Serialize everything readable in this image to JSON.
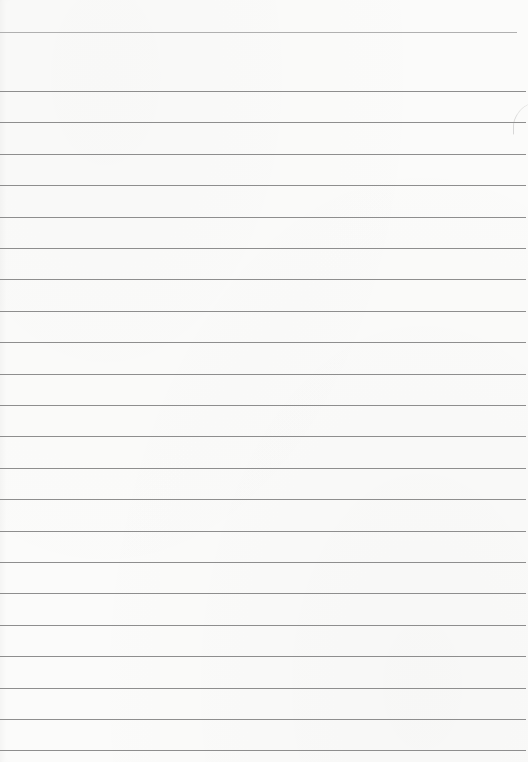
{
  "paper": {
    "width": 528,
    "height": 762,
    "background": "#fbfbfa",
    "line_color": "#8e8e8e",
    "header_line_color": "#b0b0b0",
    "header_line_y": 32,
    "first_rule_y": 91,
    "rule_spacing": 31.4,
    "rule_count": 23,
    "content_text": ""
  }
}
